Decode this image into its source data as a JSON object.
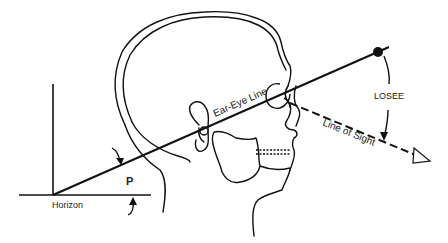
{
  "diagram": {
    "title": "",
    "labels": {
      "ear_eye_line": "Ear-Eye Line",
      "losee": "LOSEE",
      "line_of_sight": "Line of Sight",
      "p_angle": "P",
      "horizon": "Horizon"
    },
    "colors": {
      "stroke": "#111111",
      "background": "#ffffff"
    },
    "elements": [
      "head-profile-outline",
      "ear",
      "eye",
      "jaw-and-teeth",
      "neck",
      "vertical-axis",
      "horizon-line",
      "ear-eye-line",
      "line-of-sight-dashed",
      "losee-arc",
      "posture-angle-arrows"
    ]
  }
}
